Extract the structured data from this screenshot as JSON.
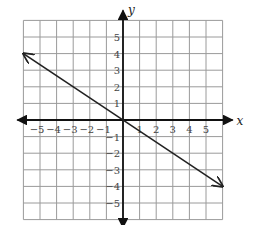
{
  "chart_data": {
    "type": "line",
    "title": "",
    "xlabel": "x",
    "ylabel": "y",
    "xlim": [
      -6,
      6
    ],
    "ylim": [
      -6,
      6
    ],
    "grid": true,
    "x_ticks": [
      -5,
      -4,
      -3,
      -2,
      -1,
      1,
      2,
      3,
      4,
      5
    ],
    "y_ticks": [
      5,
      4,
      3,
      2,
      1,
      -1,
      -2,
      -3,
      -4,
      -5
    ],
    "x_tick_labels": [
      "−5",
      "−4",
      "−3",
      "−2",
      "−1",
      "1",
      "2",
      "3",
      "4",
      "5"
    ],
    "y_tick_labels": [
      "5",
      "4",
      "3",
      "2",
      "1",
      "−1",
      "−2",
      "−3",
      "−4",
      "−5"
    ],
    "series": [
      {
        "name": "line",
        "equation": "y = -2/3 x",
        "x": [
          -6,
          0,
          6
        ],
        "y": [
          4,
          0,
          -4
        ],
        "arrows_both_ends": true
      }
    ],
    "legend": null
  },
  "colors": {
    "grid": "#9a9a9a",
    "axis": "#111111",
    "line": "#222222"
  }
}
